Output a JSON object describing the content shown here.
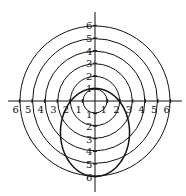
{
  "diagram": {
    "type": "polar-grid",
    "center": {
      "x": 95,
      "y": 101
    },
    "unit_px": 12.6,
    "circle_radii": [
      1,
      2,
      3,
      4,
      5,
      6
    ],
    "x_axis_labels_left": [
      "6",
      "5",
      "4",
      "3",
      "2",
      "1"
    ],
    "x_axis_labels_right": [
      "1",
      "2",
      "3",
      "4",
      "5",
      "6"
    ],
    "y_axis_labels_up": [
      "1",
      "2",
      "3",
      "4",
      "5",
      "6"
    ],
    "y_axis_labels_down": [
      "1",
      "2",
      "3",
      "4",
      "5",
      "6"
    ],
    "curve": {
      "description": "closed oval (conic) through (0,1), (±2,0), (0,-6)",
      "e": 0.714,
      "ep": 1.714
    },
    "stroke_color": "#111111"
  }
}
